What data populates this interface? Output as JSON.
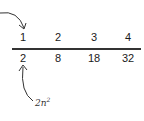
{
  "diagram": {
    "top_row": [
      "1",
      "2",
      "3",
      "4"
    ],
    "bottom_row": [
      "2",
      "8",
      "18",
      "32"
    ],
    "formula": {
      "base": "2n",
      "exponent": "2"
    },
    "arrows": [
      {
        "name": "arrow-to-first-term",
        "from": "left edge",
        "to": "top_row.0"
      },
      {
        "name": "arrow-from-formula",
        "from": "formula",
        "to": "bottom_row.0"
      }
    ]
  }
}
